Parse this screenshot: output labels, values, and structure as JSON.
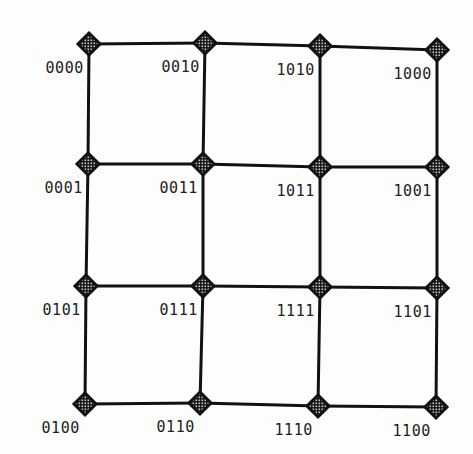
{
  "diagram": {
    "type": "4x4 mesh / Gray-code grid",
    "columns_x": [
      89,
      205,
      320,
      437
    ],
    "rows_y": [
      46,
      165,
      284,
      404
    ],
    "nodes": [
      {
        "row": 0,
        "col": 0,
        "x": 89,
        "y": 44,
        "label": "0000"
      },
      {
        "row": 0,
        "col": 1,
        "x": 205,
        "y": 43,
        "label": "0010"
      },
      {
        "row": 0,
        "col": 2,
        "x": 320,
        "y": 46,
        "label": "1010"
      },
      {
        "row": 0,
        "col": 3,
        "x": 437,
        "y": 50,
        "label": "1000"
      },
      {
        "row": 1,
        "col": 0,
        "x": 88,
        "y": 164,
        "label": "0001"
      },
      {
        "row": 1,
        "col": 1,
        "x": 203,
        "y": 164,
        "label": "0011"
      },
      {
        "row": 1,
        "col": 2,
        "x": 320,
        "y": 167,
        "label": "1011"
      },
      {
        "row": 1,
        "col": 3,
        "x": 437,
        "y": 167,
        "label": "1001"
      },
      {
        "row": 2,
        "col": 0,
        "x": 86,
        "y": 286,
        "label": "0101"
      },
      {
        "row": 2,
        "col": 1,
        "x": 203,
        "y": 286,
        "label": "0111"
      },
      {
        "row": 2,
        "col": 2,
        "x": 320,
        "y": 287,
        "label": "1111"
      },
      {
        "row": 2,
        "col": 3,
        "x": 437,
        "y": 288,
        "label": "1101"
      },
      {
        "row": 3,
        "col": 0,
        "x": 85,
        "y": 404,
        "label": "0100"
      },
      {
        "row": 3,
        "col": 1,
        "x": 200,
        "y": 403,
        "label": "0110"
      },
      {
        "row": 3,
        "col": 2,
        "x": 318,
        "y": 406,
        "label": "1110"
      },
      {
        "row": 3,
        "col": 3,
        "x": 436,
        "y": 407,
        "label": "1100"
      }
    ],
    "colors": {
      "line": "#111111",
      "node_fill": "#111111",
      "node_dot": "#9a9a9a",
      "text": "#222222"
    }
  }
}
